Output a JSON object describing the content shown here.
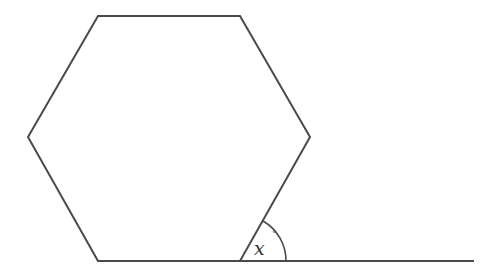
{
  "diagram": {
    "shape": "regular hexagon",
    "stroke_color": "#4a4a4a",
    "background": "#ffffff",
    "vertices": [
      [
        98,
        16
      ],
      [
        240,
        16
      ],
      [
        310,
        137
      ],
      [
        240,
        261
      ],
      [
        98,
        261
      ],
      [
        28,
        137
      ]
    ],
    "extension_line": {
      "from": [
        240,
        261
      ],
      "to": [
        474,
        261
      ]
    },
    "angle": {
      "vertex": [
        240,
        261
      ],
      "radius": 46,
      "label_var": "x",
      "label_unit": "°"
    }
  }
}
